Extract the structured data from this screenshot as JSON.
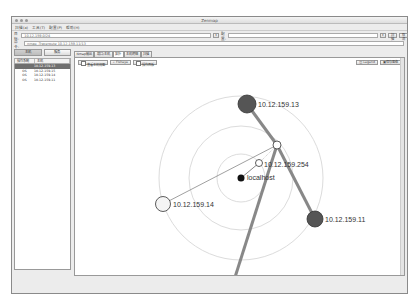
{
  "window": {
    "title": "Zenmap"
  },
  "menu": [
    "扫描(a)",
    "工具(T)",
    "配置(P)",
    "帮助(H)"
  ],
  "target": {
    "label": "目标:",
    "value": "10.12.159.0/24",
    "profile_label": "配置:",
    "profile_value": "",
    "scan_button": "扫描",
    "cancel_button": "取消"
  },
  "command": {
    "label": "命令:",
    "value": "nmap -Traceroute 10.12.159.11/13"
  },
  "sidebar": {
    "tabs": [
      "主机",
      "服务"
    ],
    "columns": [
      "操作系统",
      "主机"
    ],
    "hosts": [
      {
        "os": "",
        "host": "10.12.159.13",
        "selected": true
      },
      {
        "os": "OS",
        "host": "10.12.159.15"
      },
      {
        "os": "OS",
        "host": "10.12.159.14"
      },
      {
        "os": "OS",
        "host": "10.12.159.11"
      }
    ]
  },
  "main_tabs": [
    "Nmap输出",
    "端口/主机",
    "拓扑",
    "主机明细",
    "扫描"
  ],
  "active_tab": "拓扑",
  "topology_toolbar": {
    "hosts_viewer": "查看主机视图",
    "fisheye": "Fisheye",
    "controls": "操作面板",
    "legend": "Legend",
    "save": "保存图像"
  },
  "topology": {
    "nodes": [
      {
        "id": "localhost",
        "label": "localhost",
        "color": "#111111"
      },
      {
        "id": "10.12.159.254",
        "label": "10.12.159.254",
        "color": "#ffffff"
      },
      {
        "id": "router",
        "label": "",
        "color": "#ffffff"
      },
      {
        "id": "10.12.159.13",
        "label": "10.12.159.13",
        "color": "#555555"
      },
      {
        "id": "10.12.159.11",
        "label": "10.12.159.11",
        "color": "#555555"
      },
      {
        "id": "10.12.159.14",
        "label": "10.12.159.14",
        "color": "#f4f4f4"
      },
      {
        "id": "10.12.159.15",
        "label": "10.12.159.15",
        "color": "#a8a8a8"
      }
    ]
  }
}
